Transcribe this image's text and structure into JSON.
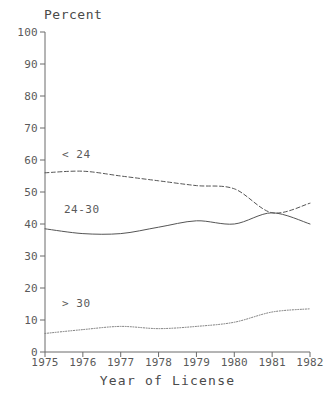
{
  "chart_data": {
    "type": "line",
    "title": "",
    "ylabel": "Percent",
    "xlabel": "Year of License",
    "x": [
      1975,
      1976,
      1977,
      1978,
      1979,
      1980,
      1981,
      1982
    ],
    "categories": [
      "1975",
      "1976",
      "1977",
      "1978",
      "1979",
      "1980",
      "1981",
      "1982"
    ],
    "ylim": [
      0,
      100
    ],
    "xlim": [
      1975,
      1982
    ],
    "ytick_labels": [
      "0",
      "10",
      "20",
      "30",
      "40",
      "50",
      "60",
      "70",
      "80",
      "90",
      "100"
    ],
    "ytick_values": [
      0,
      10,
      20,
      30,
      40,
      50,
      60,
      70,
      80,
      90,
      100
    ],
    "grid": false,
    "legend_position": "inline-labels",
    "series": [
      {
        "name": "< 24",
        "style": "dashed",
        "color": "#555555",
        "values": [
          56.0,
          56.5,
          55.0,
          53.5,
          52.0,
          51.0,
          43.5,
          46.5
        ],
        "label_x": 1975.45,
        "label_y": 61.5
      },
      {
        "name": "24-30",
        "style": "solid",
        "color": "#555555",
        "values": [
          38.5,
          37.0,
          37.0,
          39.0,
          41.0,
          40.0,
          43.5,
          40.0
        ],
        "label_x": 1975.5,
        "label_y": 44.5
      },
      {
        "name": "> 30",
        "style": "dotted",
        "color": "#777777",
        "values": [
          5.8,
          7.0,
          8.0,
          7.3,
          8.0,
          9.3,
          12.5,
          13.5
        ],
        "label_x": 1975.45,
        "label_y": 15.0
      }
    ]
  }
}
